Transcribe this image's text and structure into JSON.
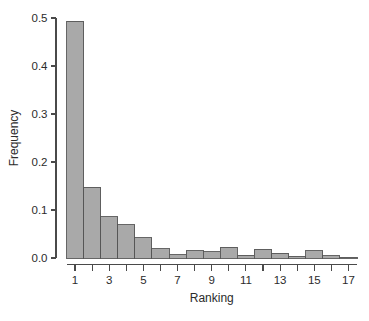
{
  "chart_data": {
    "type": "bar",
    "title": "",
    "subtitle": "",
    "xlabel": "Ranking",
    "ylabel": "Frequency",
    "xlim": [
      0.5,
      17.8
    ],
    "ylim": [
      0.0,
      0.5
    ],
    "grid": false,
    "legend": null,
    "categories": [
      1,
      2,
      3,
      4,
      5,
      6,
      7,
      8,
      9,
      10,
      11,
      12,
      13,
      14,
      15,
      16,
      17
    ],
    "values": [
      0.493,
      0.147,
      0.086,
      0.069,
      0.042,
      0.019,
      0.007,
      0.015,
      0.013,
      0.022,
      0.006,
      0.018,
      0.01,
      0.004,
      0.015,
      0.005,
      0.002
    ],
    "x_tick_labels": [
      "1",
      "3",
      "5",
      "7",
      "9",
      "11",
      "13",
      "15",
      "17"
    ],
    "x_tick_values": [
      1,
      3,
      5,
      7,
      9,
      11,
      13,
      15,
      17
    ],
    "x_minor_tick_values": [
      2,
      4,
      6,
      8,
      10,
      12,
      14,
      16
    ],
    "y_tick_labels": [
      "0.0",
      "0.1",
      "0.2",
      "0.3",
      "0.4",
      "0.5"
    ],
    "y_tick_values": [
      0.0,
      0.1,
      0.2,
      0.3,
      0.4,
      0.5
    ],
    "bar_fill_color": "#a9a9a9",
    "bar_edge_color": "#555555",
    "axis_color": "#4a4a4a",
    "background_color": "#ffffff"
  },
  "axis": {
    "x_title": "Ranking",
    "y_title": "Frequency"
  }
}
